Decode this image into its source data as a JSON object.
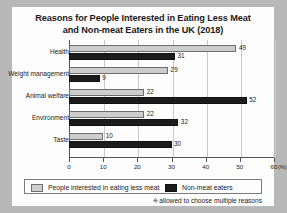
{
  "chart_data": {
    "type": "bar",
    "orientation": "horizontal",
    "title": "Reasons for People Interested in Eating Less Meat and Non-meat Eaters in the UK (2018)",
    "title_line1": "Reasons for People Interested in Eating Less Meat",
    "title_line2": "and Non-meat Eaters in the UK (2018)",
    "categories": [
      "Health",
      "Weight management",
      "Animal welfare",
      "Environment",
      "Taste"
    ],
    "series": [
      {
        "name": "People interested in eating less meat",
        "color": "#cdcdcd",
        "values": [
          49,
          29,
          22,
          22,
          10
        ]
      },
      {
        "name": "Non-meat eaters",
        "color": "#1c1c1c",
        "values": [
          31,
          9,
          52,
          32,
          30
        ]
      }
    ],
    "xlabel": "",
    "ylabel": "",
    "xlim": [
      0,
      60
    ],
    "xticks": [
      0,
      10,
      20,
      30,
      40,
      50,
      60
    ],
    "xtick_labels": [
      "0",
      "10",
      "20",
      "30",
      "40",
      "50",
      "60"
    ],
    "x_unit": "(%)",
    "grid": true,
    "legend_position": "bottom",
    "annotation": "allowed to choose multiple reasons",
    "annotation_symbol": "※"
  },
  "legend": {
    "items": [
      {
        "label": "People interested in eating less meat",
        "swatch": "light-gray-swatch"
      },
      {
        "label": "Non-meat eaters",
        "swatch": "black-swatch"
      }
    ]
  },
  "footnote": {
    "symbol": "※",
    "text": "allowed to choose multiple reasons"
  }
}
